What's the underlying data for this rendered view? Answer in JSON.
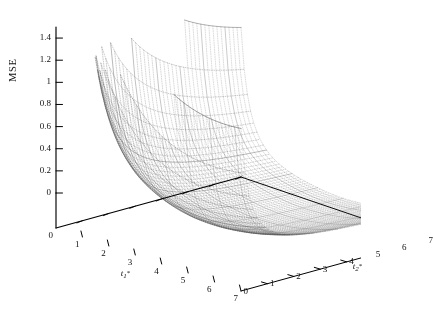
{
  "figure": {
    "kind": "3d-surface-mesh",
    "background_color": "#ffffff",
    "mesh_color": "#4a4a4a",
    "axis_color": "#000000"
  },
  "axes": {
    "z": {
      "title": "MSE",
      "ticks": [
        "0",
        "0.2",
        "0.4",
        "0.6",
        "0.8",
        "1",
        "1.2",
        "1.4"
      ],
      "min": 0,
      "max": 1.5
    },
    "x": {
      "title_base": "t",
      "title_sub": "1",
      "title_star": "*",
      "ticks": [
        "0",
        "1",
        "2",
        "3",
        "4",
        "5",
        "6",
        "7"
      ],
      "min": 0,
      "max": 7
    },
    "y": {
      "title_base": "t",
      "title_sub": "2",
      "title_star": "*",
      "ticks": [
        "0",
        "1",
        "2",
        "3",
        "4",
        "5",
        "6",
        "7"
      ],
      "min": 0,
      "max": 7
    }
  },
  "chart_data": {
    "type": "surface",
    "title": "",
    "xlabel": "t1*",
    "ylabel": "t2*",
    "zlabel": "MSE",
    "xlim": [
      0,
      7
    ],
    "ylim": [
      0,
      7
    ],
    "zlim": [
      0,
      1.5
    ],
    "grid": false,
    "legend": "none",
    "x": [
      0,
      0.5,
      1,
      1.5,
      2,
      2.5,
      3,
      3.5,
      4,
      4.5,
      5,
      5.5,
      6,
      6.5,
      7
    ],
    "y": [
      0,
      0.5,
      1,
      1.5,
      2,
      2.5,
      3,
      3.5,
      4,
      4.5,
      5,
      5.5,
      6,
      6.5,
      7
    ],
    "z_description": "Convex valley surface: MSE is high (up to ~1.5) near small t1* and small t2*, decreases to a shallow minimum (~0.05) near t1*~3-5 and t2*~4-7, and stays low across the far plateau.",
    "z": [
      [
        1.5,
        1.32,
        1.18,
        1.07,
        0.99,
        0.93,
        0.88,
        0.85,
        0.82,
        0.8,
        0.79,
        0.78,
        0.77,
        0.77,
        0.76
      ],
      [
        1.3,
        1.1,
        0.95,
        0.83,
        0.74,
        0.67,
        0.62,
        0.58,
        0.55,
        0.53,
        0.51,
        0.5,
        0.49,
        0.49,
        0.48
      ],
      [
        1.13,
        0.92,
        0.76,
        0.64,
        0.55,
        0.48,
        0.43,
        0.39,
        0.36,
        0.34,
        0.32,
        0.31,
        0.3,
        0.3,
        0.29
      ],
      [
        1.01,
        0.79,
        0.62,
        0.5,
        0.41,
        0.34,
        0.29,
        0.25,
        0.23,
        0.21,
        0.19,
        0.18,
        0.18,
        0.17,
        0.17
      ],
      [
        0.94,
        0.71,
        0.53,
        0.41,
        0.32,
        0.25,
        0.21,
        0.17,
        0.15,
        0.13,
        0.12,
        0.11,
        0.11,
        0.1,
        0.1
      ],
      [
        0.9,
        0.66,
        0.48,
        0.35,
        0.26,
        0.2,
        0.16,
        0.13,
        0.11,
        0.09,
        0.08,
        0.08,
        0.07,
        0.07,
        0.07
      ],
      [
        0.88,
        0.63,
        0.45,
        0.32,
        0.23,
        0.17,
        0.13,
        0.1,
        0.08,
        0.07,
        0.06,
        0.06,
        0.05,
        0.05,
        0.05
      ],
      [
        0.88,
        0.62,
        0.43,
        0.3,
        0.21,
        0.15,
        0.11,
        0.09,
        0.07,
        0.06,
        0.05,
        0.05,
        0.04,
        0.04,
        0.04
      ],
      [
        0.89,
        0.62,
        0.43,
        0.3,
        0.21,
        0.15,
        0.11,
        0.08,
        0.06,
        0.05,
        0.05,
        0.04,
        0.04,
        0.04,
        0.04
      ],
      [
        0.91,
        0.63,
        0.44,
        0.3,
        0.21,
        0.15,
        0.11,
        0.08,
        0.06,
        0.05,
        0.05,
        0.04,
        0.04,
        0.04,
        0.04
      ],
      [
        0.93,
        0.65,
        0.45,
        0.31,
        0.22,
        0.16,
        0.12,
        0.09,
        0.07,
        0.06,
        0.05,
        0.05,
        0.04,
        0.04,
        0.04
      ],
      [
        0.96,
        0.67,
        0.47,
        0.33,
        0.23,
        0.17,
        0.13,
        0.1,
        0.08,
        0.06,
        0.06,
        0.05,
        0.05,
        0.05,
        0.05
      ],
      [
        0.99,
        0.7,
        0.49,
        0.35,
        0.25,
        0.18,
        0.14,
        0.11,
        0.09,
        0.07,
        0.06,
        0.06,
        0.05,
        0.05,
        0.05
      ],
      [
        1.03,
        0.73,
        0.52,
        0.37,
        0.27,
        0.2,
        0.15,
        0.12,
        0.1,
        0.08,
        0.07,
        0.07,
        0.06,
        0.06,
        0.06
      ],
      [
        1.07,
        0.76,
        0.55,
        0.4,
        0.29,
        0.22,
        0.17,
        0.13,
        0.11,
        0.09,
        0.08,
        0.08,
        0.07,
        0.07,
        0.07
      ]
    ]
  }
}
